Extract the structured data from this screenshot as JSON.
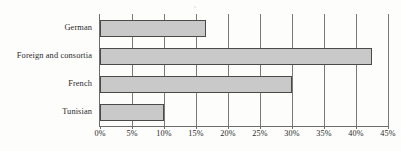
{
  "chart_data": {
    "type": "bar",
    "orientation": "horizontal",
    "title": "",
    "subtitle": "",
    "xlabel": "",
    "ylabel": "",
    "categories": [
      "German",
      "Foreign and consortia",
      "French",
      "Tunisian"
    ],
    "values": [
      16.5,
      42.5,
      30,
      10
    ],
    "value_suffix": "%",
    "xlim": [
      0,
      45
    ],
    "xticks": [
      0,
      5,
      10,
      15,
      20,
      25,
      30,
      35,
      40,
      45
    ],
    "xtick_labels": [
      "0%",
      "5%",
      "10%",
      "15%",
      "20%",
      "25%",
      "30%",
      "35%",
      "40%",
      "45%"
    ],
    "grid": "vertical",
    "legend": null,
    "series": [
      {
        "name": "",
        "values": [
          16.5,
          42.5,
          30,
          10
        ]
      }
    ],
    "colors": {
      "bar_fill": "#c9c9c9",
      "bar_border": "#4a4a4a",
      "gridline": "#7a7a7a",
      "axis": "#6d6d6d",
      "text": "#2b2b2b",
      "background": "#fdfdfb"
    }
  }
}
